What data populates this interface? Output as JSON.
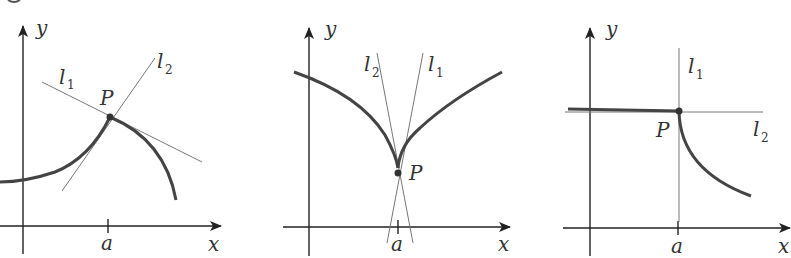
{
  "figure": {
    "panels": [
      {
        "id": "panel-1",
        "description": "corner point: left and right tangents differ",
        "axis_x_label": "x",
        "axis_y_label": "y",
        "tick_label": "a",
        "point_label": "P",
        "line1_label": "l",
        "line1_sub": "1",
        "line2_label": "l",
        "line2_sub": "2"
      },
      {
        "id": "panel-2",
        "description": "cusp: tangent lines become vertical from both sides",
        "axis_x_label": "x",
        "axis_y_label": "y",
        "tick_label": "a",
        "point_label": "P",
        "line1_label": "l",
        "line1_sub": "1",
        "line2_label": "l",
        "line2_sub": "2"
      },
      {
        "id": "panel-3",
        "description": "vertical tangent on one side, horizontal on other",
        "axis_x_label": "x",
        "axis_y_label": "y",
        "tick_label": "a",
        "point_label": "P",
        "line1_label": "l",
        "line1_sub": "1",
        "line2_label": "l",
        "line2_sub": "2"
      }
    ],
    "colors": {
      "curve": "#444444",
      "axis": "#222222",
      "tangent": "#777777"
    }
  }
}
